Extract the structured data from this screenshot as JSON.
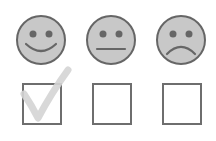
{
  "rating": {
    "options": [
      {
        "id": "happy",
        "icon": "happy-face-icon",
        "checked": true
      },
      {
        "id": "neutral",
        "icon": "neutral-face-icon",
        "checked": false
      },
      {
        "id": "sad",
        "icon": "sad-face-icon",
        "checked": false
      }
    ],
    "colors": {
      "face_fill": "#c8c8c8",
      "stroke": "#666666",
      "check_mark": "#d4d4d4",
      "background": "#ffffff"
    }
  }
}
